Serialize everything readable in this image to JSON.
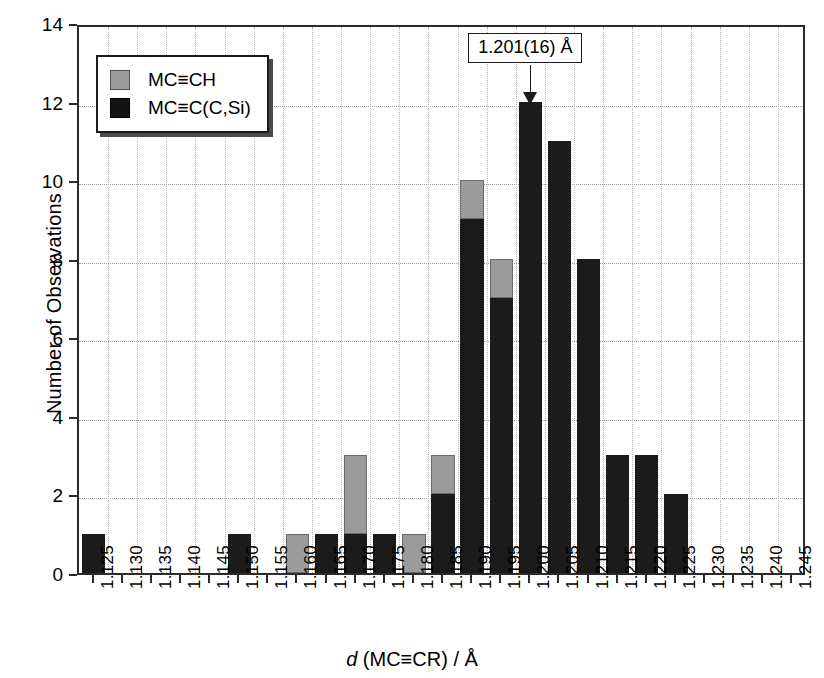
{
  "chart_data": {
    "type": "bar",
    "title": "",
    "subtitle": "",
    "xlabel": "d (MC≡CR) / Å",
    "ylabel": "Number of Observations",
    "xlim": [
      1.1225,
      1.2475
    ],
    "ylim": [
      0,
      14
    ],
    "ytick_values": [
      0,
      2,
      4,
      6,
      8,
      10,
      12,
      14
    ],
    "ytick_labels": [
      "0",
      "2",
      "4",
      "6",
      "8",
      "10",
      "12",
      "14"
    ],
    "grid": true,
    "grid_axes": "both",
    "stacked": true,
    "bar_width_fraction": 0.8,
    "legend_position": "upper left",
    "categories": [
      "1.125",
      "1.130",
      "1.135",
      "1.140",
      "1.145",
      "1.150",
      "1.155",
      "1.160",
      "1.165",
      "1.170",
      "1.175",
      "1.180",
      "1.185",
      "1.190",
      "1.195",
      "1.200",
      "1.205",
      "1.210",
      "1.215",
      "1.220",
      "1.225",
      "1.230",
      "1.235",
      "1.240",
      "1.245"
    ],
    "series": [
      {
        "name": "MC≡C(C,Si)",
        "color": "#1b1b1b",
        "values": [
          1,
          0,
          0,
          0,
          0,
          1,
          0,
          0,
          1,
          1,
          1,
          0,
          2,
          9,
          7,
          12,
          11,
          8,
          3,
          3,
          2,
          0,
          0,
          0,
          0
        ]
      },
      {
        "name": "MC≡CH",
        "color": "#9b9b9b",
        "values": [
          0,
          0,
          0,
          0,
          0,
          0,
          0,
          1,
          0,
          2,
          0,
          1,
          1,
          1,
          1,
          0,
          0,
          0,
          0,
          0,
          0,
          0,
          0,
          0,
          0
        ]
      }
    ],
    "totals": [
      1,
      0,
      0,
      0,
      0,
      1,
      0,
      1,
      1,
      3,
      1,
      1,
      3,
      10,
      8,
      12,
      11,
      8,
      3,
      3,
      2,
      0,
      0,
      0,
      0
    ],
    "annotations": [
      {
        "text": "1.201(16) Å",
        "points_to_category": "1.200",
        "points_to_value": 12,
        "type": "arrow-callout"
      }
    ]
  },
  "legend": {
    "entries": [
      {
        "label": "MC≡CH",
        "swatch": "light-gray-swatch"
      },
      {
        "label": "MC≡C(C,Si)",
        "swatch": "black-swatch"
      }
    ]
  },
  "axis_titles": {
    "x_italic_part": "d",
    "x_upright_part": "(MC≡CR) / Å",
    "y": "Number of Observations"
  }
}
